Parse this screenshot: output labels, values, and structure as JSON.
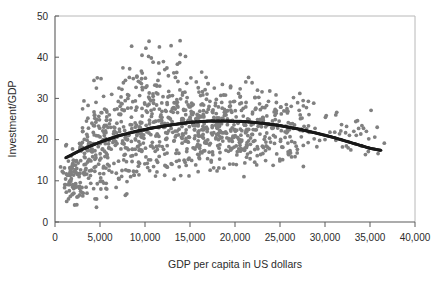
{
  "chart_data": {
    "type": "scatter",
    "title": "",
    "xlabel": "GDP per capita in US dollars",
    "ylabel": "Investment/GDP",
    "xlim": [
      0,
      40000
    ],
    "ylim": [
      0,
      50
    ],
    "xticks": [
      0,
      5000,
      10000,
      15000,
      20000,
      25000,
      30000,
      35000,
      40000
    ],
    "xtick_labels": [
      "0",
      "5,000",
      "10,000",
      "15,000",
      "20,000",
      "25,000",
      "30,000",
      "35,000",
      "40,000"
    ],
    "yticks": [
      0,
      10,
      20,
      30,
      40,
      50
    ],
    "ytick_labels": [
      "0",
      "10",
      "20",
      "30",
      "40",
      "50"
    ],
    "grid": false,
    "legend": null,
    "point_color": "#808080",
    "fit_color": "#1a1a1a",
    "axis_color": "#5a5a5a",
    "frame_color": "#b8b8b8",
    "marker_size": 1.9,
    "series": [
      {
        "name": "countries",
        "marker": "circle",
        "color": "#808080",
        "n_points": 980,
        "description": "Cross-country observations of investment share of GDP against GDP per capita; dense cloud rising from ~15 at low income, broad band 15-35 in the 5,000-25,000 range with a fat upper tail to 44, thinning sharply above 27,000."
      },
      {
        "name": "quadratic fit",
        "marker": "line",
        "color": "#1a1a1a",
        "description": "Concave fitted curve rising from 15.6 at GDP 1,200, peaking near 24.6 around GDP 17,500, declining to 17.5 at GDP 36,000.",
        "fit_points": [
          [
            1200,
            15.6
          ],
          [
            3000,
            17.6
          ],
          [
            5000,
            19.4
          ],
          [
            7000,
            20.9
          ],
          [
            9000,
            22.0
          ],
          [
            11000,
            22.9
          ],
          [
            13000,
            23.6
          ],
          [
            15000,
            24.2
          ],
          [
            17000,
            24.5
          ],
          [
            19000,
            24.5
          ],
          [
            21000,
            24.4
          ],
          [
            23000,
            24.0
          ],
          [
            25000,
            23.4
          ],
          [
            27000,
            22.6
          ],
          [
            29000,
            21.6
          ],
          [
            31000,
            20.5
          ],
          [
            33000,
            19.2
          ],
          [
            35000,
            17.9
          ],
          [
            36200,
            17.4
          ]
        ]
      }
    ],
    "scatter_bands": [
      {
        "x_center": 1400,
        "y_center": 9.0,
        "x_spread": 400,
        "y_spread": 2.6,
        "count": 22
      },
      {
        "x_center": 1900,
        "y_center": 10.5,
        "x_spread": 600,
        "y_spread": 3.6,
        "count": 30
      },
      {
        "x_center": 2600,
        "y_center": 12.5,
        "x_spread": 700,
        "y_spread": 4.2,
        "count": 34
      },
      {
        "x_center": 3400,
        "y_center": 14.5,
        "x_spread": 800,
        "y_spread": 4.8,
        "count": 38
      },
      {
        "x_center": 4300,
        "y_center": 17.5,
        "x_spread": 900,
        "y_spread": 5.6,
        "count": 42
      },
      {
        "x_center": 5400,
        "y_center": 19.5,
        "x_spread": 1000,
        "y_spread": 5.8,
        "count": 46
      },
      {
        "x_center": 6600,
        "y_center": 20.5,
        "x_spread": 1100,
        "y_spread": 5.6,
        "count": 48
      },
      {
        "x_center": 7900,
        "y_center": 21.5,
        "x_spread": 1200,
        "y_spread": 5.8,
        "count": 52
      },
      {
        "x_center": 9200,
        "y_center": 22.5,
        "x_spread": 1200,
        "y_spread": 6.0,
        "count": 56
      },
      {
        "x_center": 10600,
        "y_center": 23.0,
        "x_spread": 1300,
        "y_spread": 6.2,
        "count": 58
      },
      {
        "x_center": 12000,
        "y_center": 23.4,
        "x_spread": 1300,
        "y_spread": 6.2,
        "count": 60
      },
      {
        "x_center": 13500,
        "y_center": 23.8,
        "x_spread": 1300,
        "y_spread": 6.2,
        "count": 60
      },
      {
        "x_center": 15000,
        "y_center": 23.8,
        "x_spread": 1300,
        "y_spread": 5.8,
        "count": 62
      },
      {
        "x_center": 16500,
        "y_center": 23.6,
        "x_spread": 1300,
        "y_spread": 5.4,
        "count": 62
      },
      {
        "x_center": 18000,
        "y_center": 23.4,
        "x_spread": 1300,
        "y_spread": 5.0,
        "count": 60
      },
      {
        "x_center": 19500,
        "y_center": 23.0,
        "x_spread": 1300,
        "y_spread": 4.8,
        "count": 58
      },
      {
        "x_center": 21000,
        "y_center": 22.8,
        "x_spread": 1300,
        "y_spread": 4.8,
        "count": 56
      },
      {
        "x_center": 22500,
        "y_center": 22.5,
        "x_spread": 1300,
        "y_spread": 4.6,
        "count": 50
      },
      {
        "x_center": 24000,
        "y_center": 22.2,
        "x_spread": 1200,
        "y_spread": 4.4,
        "count": 40
      },
      {
        "x_center": 25500,
        "y_center": 22.0,
        "x_spread": 1100,
        "y_spread": 4.0,
        "count": 30
      },
      {
        "x_center": 27000,
        "y_center": 22.5,
        "x_spread": 1000,
        "y_spread": 3.8,
        "count": 22
      },
      {
        "x_center": 28500,
        "y_center": 21.5,
        "x_spread": 900,
        "y_spread": 3.0,
        "count": 10
      },
      {
        "x_center": 31500,
        "y_center": 21.5,
        "x_spread": 900,
        "y_spread": 3.0,
        "count": 9
      },
      {
        "x_center": 33500,
        "y_center": 21.5,
        "x_spread": 900,
        "y_spread": 3.2,
        "count": 10
      },
      {
        "x_center": 35200,
        "y_center": 20.5,
        "x_spread": 800,
        "y_spread": 3.2,
        "count": 7
      }
    ],
    "outliers": [
      [
        4700,
        35.0
      ],
      [
        4600,
        32.5
      ],
      [
        5400,
        30.5
      ],
      [
        6300,
        31.0
      ],
      [
        7100,
        32.5
      ],
      [
        7600,
        33.8
      ],
      [
        8100,
        30.0
      ],
      [
        8300,
        37.2
      ],
      [
        8700,
        34.8
      ],
      [
        9100,
        35.2
      ],
      [
        9600,
        33.6
      ],
      [
        10100,
        42.2
      ],
      [
        10400,
        40.2
      ],
      [
        10700,
        39.8
      ],
      [
        10900,
        38.8
      ],
      [
        11600,
        42.5
      ],
      [
        12200,
        37.0
      ],
      [
        12600,
        35.5
      ],
      [
        12900,
        42.8
      ],
      [
        13200,
        36.2
      ],
      [
        13600,
        38.3
      ],
      [
        13900,
        44.0
      ],
      [
        14500,
        40.2
      ],
      [
        15100,
        35.0
      ],
      [
        15700,
        34.0
      ],
      [
        16300,
        36.4
      ],
      [
        17000,
        33.6
      ],
      [
        17700,
        32.5
      ],
      [
        18600,
        33.4
      ],
      [
        19500,
        32.6
      ],
      [
        20400,
        31.2
      ],
      [
        21200,
        34.0
      ],
      [
        21900,
        33.8
      ],
      [
        22500,
        32.0
      ],
      [
        23000,
        31.6
      ],
      [
        24600,
        29.0
      ],
      [
        25700,
        28.5
      ],
      [
        26500,
        30.2
      ],
      [
        27200,
        31.2
      ],
      [
        27600,
        28.2
      ],
      [
        8000,
        9.8
      ],
      [
        8400,
        11.0
      ],
      [
        8800,
        11.4
      ],
      [
        9400,
        14.2
      ],
      [
        10300,
        13.2
      ],
      [
        11400,
        14.5
      ],
      [
        12300,
        13.6
      ],
      [
        13000,
        14.0
      ],
      [
        13800,
        13.4
      ],
      [
        14800,
        15.2
      ],
      [
        16000,
        15.6
      ],
      [
        17500,
        17.0
      ],
      [
        19000,
        17.4
      ],
      [
        20600,
        17.2
      ],
      [
        22200,
        17.6
      ],
      [
        23800,
        17.8
      ],
      [
        25200,
        18.2
      ],
      [
        26800,
        18.4
      ],
      [
        1300,
        5.0
      ],
      [
        1500,
        5.6
      ],
      [
        1700,
        6.2
      ],
      [
        2100,
        7.0
      ],
      [
        3100,
        22.0
      ],
      [
        3500,
        24.5
      ],
      [
        31200,
        26.0
      ],
      [
        32400,
        23.2
      ],
      [
        33200,
        22.0
      ],
      [
        34100,
        23.4
      ],
      [
        34600,
        22.0
      ],
      [
        35800,
        23.0
      ],
      [
        35900,
        16.6
      ],
      [
        30000,
        20.0
      ],
      [
        28800,
        20.2
      ],
      [
        29400,
        19.8
      ]
    ]
  },
  "figure": {
    "axis_label_x": "GDP per capita in US dollars",
    "axis_label_y": "Investment/GDP"
  }
}
